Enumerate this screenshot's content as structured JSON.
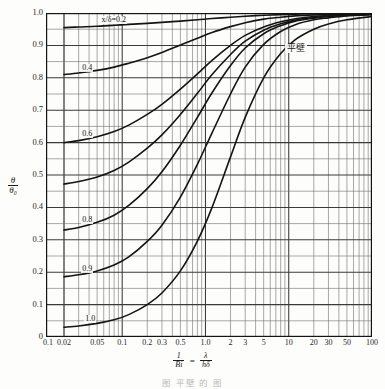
{
  "chart_data": {
    "type": "line",
    "title": "",
    "annotation": "平壁",
    "xlabel_parts": {
      "num": "1",
      "den": "Bi",
      "eq": "=",
      "num2": "λ",
      "den2": "hδ"
    },
    "ylabel_parts": {
      "num": "θ",
      "den": "θ₀"
    },
    "xscale": "log",
    "yscale": "linear",
    "xlim": [
      0.1,
      100
    ],
    "ylim": [
      0,
      1.0
    ],
    "grid": true,
    "xticks": [
      {
        "v": 0.1,
        "label": "0.1"
      },
      {
        "v": 0.02,
        "label": "0.02"
      },
      {
        "v": 0.05,
        "label": "0.05"
      },
      {
        "v": 0.1,
        "label": "0.1"
      },
      {
        "v": 0.2,
        "label": "0.2"
      },
      {
        "v": 0.3,
        "label": "0.3"
      },
      {
        "v": 0.5,
        "label": "0.5"
      },
      {
        "v": 1.0,
        "label": "1.0"
      },
      {
        "v": 2,
        "label": "2"
      },
      {
        "v": 3,
        "label": "3"
      },
      {
        "v": 5,
        "label": "5"
      },
      {
        "v": 10,
        "label": "10"
      },
      {
        "v": 20,
        "label": "20"
      },
      {
        "v": 30,
        "label": "30"
      },
      {
        "v": 50,
        "label": "50"
      },
      {
        "v": 100,
        "label": "100"
      }
    ],
    "yticks": [
      {
        "v": 0,
        "label": "0"
      },
      {
        "v": 0.1,
        "label": "0.1"
      },
      {
        "v": 0.2,
        "label": "0.2"
      },
      {
        "v": 0.3,
        "label": "0.3"
      },
      {
        "v": 0.4,
        "label": "0.4"
      },
      {
        "v": 0.5,
        "label": "0.5"
      },
      {
        "v": 0.6,
        "label": "0.6"
      },
      {
        "v": 0.7,
        "label": "0.7"
      },
      {
        "v": 0.8,
        "label": "0.8"
      },
      {
        "v": 0.9,
        "label": "0.9"
      },
      {
        "v": 1.0,
        "label": "1.0"
      }
    ],
    "series": [
      {
        "name": "x/δ=0.2",
        "label": "x/δ=0.2",
        "label_x": 0.055,
        "label_y": 0.975,
        "points": [
          [
            0.02,
            0.955
          ],
          [
            0.03,
            0.957
          ],
          [
            0.05,
            0.959
          ],
          [
            0.08,
            0.962
          ],
          [
            0.12,
            0.965
          ],
          [
            0.2,
            0.968
          ],
          [
            0.3,
            0.971
          ],
          [
            0.5,
            0.975
          ],
          [
            0.8,
            0.979
          ],
          [
            1.2,
            0.983
          ],
          [
            2,
            0.987
          ],
          [
            3,
            0.99
          ],
          [
            5,
            0.993
          ],
          [
            8,
            0.995
          ],
          [
            12,
            0.9962
          ],
          [
            20,
            0.9972
          ],
          [
            30,
            0.9978
          ],
          [
            50,
            0.9984
          ],
          [
            100,
            0.999
          ]
        ]
      },
      {
        "name": "x/δ=0.4",
        "label": "0.4",
        "label_x": 0.034,
        "label_y": 0.828,
        "points": [
          [
            0.02,
            0.81
          ],
          [
            0.03,
            0.815
          ],
          [
            0.05,
            0.823
          ],
          [
            0.08,
            0.833
          ],
          [
            0.12,
            0.845
          ],
          [
            0.2,
            0.862
          ],
          [
            0.3,
            0.878
          ],
          [
            0.5,
            0.901
          ],
          [
            0.8,
            0.922
          ],
          [
            1.2,
            0.94
          ],
          [
            2,
            0.958
          ],
          [
            3,
            0.97
          ],
          [
            5,
            0.981
          ],
          [
            8,
            0.987
          ],
          [
            12,
            0.991
          ],
          [
            20,
            0.994
          ],
          [
            30,
            0.9955
          ],
          [
            50,
            0.997
          ],
          [
            100,
            0.998
          ]
        ]
      },
      {
        "name": "x/δ=0.6",
        "label": "0.6",
        "label_x": 0.034,
        "label_y": 0.625,
        "points": [
          [
            0.02,
            0.6
          ],
          [
            0.03,
            0.606
          ],
          [
            0.05,
            0.618
          ],
          [
            0.08,
            0.634
          ],
          [
            0.12,
            0.654
          ],
          [
            0.2,
            0.687
          ],
          [
            0.3,
            0.718
          ],
          [
            0.5,
            0.765
          ],
          [
            0.8,
            0.812
          ],
          [
            1.2,
            0.854
          ],
          [
            2,
            0.9
          ],
          [
            3,
            0.931
          ],
          [
            5,
            0.957
          ],
          [
            8,
            0.973
          ],
          [
            12,
            0.982
          ],
          [
            20,
            0.989
          ],
          [
            30,
            0.992
          ],
          [
            50,
            0.995
          ],
          [
            100,
            0.997
          ]
        ]
      },
      {
        "name": "x/δ=0.7",
        "label": "",
        "label_x": null,
        "label_y": null,
        "points": [
          [
            0.02,
            0.472
          ],
          [
            0.03,
            0.48
          ],
          [
            0.05,
            0.494
          ],
          [
            0.08,
            0.514
          ],
          [
            0.12,
            0.54
          ],
          [
            0.2,
            0.583
          ],
          [
            0.3,
            0.624
          ],
          [
            0.5,
            0.687
          ],
          [
            0.8,
            0.752
          ],
          [
            1.2,
            0.81
          ],
          [
            2,
            0.872
          ],
          [
            3,
            0.913
          ],
          [
            5,
            0.947
          ],
          [
            8,
            0.967
          ],
          [
            12,
            0.978
          ],
          [
            20,
            0.986
          ],
          [
            30,
            0.99
          ],
          [
            50,
            0.994
          ],
          [
            100,
            0.996
          ]
        ]
      },
      {
        "name": "x/δ=0.8",
        "label": "0.8",
        "label_x": 0.034,
        "label_y": 0.358,
        "points": [
          [
            0.02,
            0.33
          ],
          [
            0.03,
            0.338
          ],
          [
            0.05,
            0.354
          ],
          [
            0.08,
            0.376
          ],
          [
            0.12,
            0.406
          ],
          [
            0.2,
            0.458
          ],
          [
            0.3,
            0.51
          ],
          [
            0.5,
            0.592
          ],
          [
            0.8,
            0.678
          ],
          [
            1.2,
            0.754
          ],
          [
            2,
            0.838
          ],
          [
            3,
            0.892
          ],
          [
            5,
            0.936
          ],
          [
            8,
            0.961
          ],
          [
            12,
            0.975
          ],
          [
            20,
            0.984
          ],
          [
            30,
            0.989
          ],
          [
            50,
            0.993
          ],
          [
            100,
            0.996
          ]
        ]
      },
      {
        "name": "x/δ=0.9",
        "label": "0.9",
        "label_x": 0.034,
        "label_y": 0.208,
        "points": [
          [
            0.02,
            0.186
          ],
          [
            0.03,
            0.192
          ],
          [
            0.05,
            0.204
          ],
          [
            0.08,
            0.222
          ],
          [
            0.12,
            0.247
          ],
          [
            0.2,
            0.295
          ],
          [
            0.3,
            0.345
          ],
          [
            0.5,
            0.432
          ],
          [
            0.8,
            0.533
          ],
          [
            1.2,
            0.63
          ],
          [
            2,
            0.75
          ],
          [
            3,
            0.833
          ],
          [
            5,
            0.903
          ],
          [
            8,
            0.943
          ],
          [
            12,
            0.964
          ],
          [
            20,
            0.979
          ],
          [
            30,
            0.985
          ],
          [
            50,
            0.991
          ],
          [
            100,
            0.995
          ]
        ]
      },
      {
        "name": "x/δ=1.0",
        "label": "1.0",
        "label_x": 0.037,
        "label_y": 0.052,
        "points": [
          [
            0.02,
            0.03
          ],
          [
            0.03,
            0.034
          ],
          [
            0.05,
            0.042
          ],
          [
            0.08,
            0.053
          ],
          [
            0.12,
            0.069
          ],
          [
            0.2,
            0.1
          ],
          [
            0.3,
            0.136
          ],
          [
            0.5,
            0.204
          ],
          [
            0.8,
            0.296
          ],
          [
            1.2,
            0.4
          ],
          [
            2,
            0.556
          ],
          [
            3,
            0.678
          ],
          [
            5,
            0.8
          ],
          [
            8,
            0.875
          ],
          [
            12,
            0.918
          ],
          [
            20,
            0.95
          ],
          [
            30,
            0.966
          ],
          [
            50,
            0.979
          ],
          [
            100,
            0.989
          ]
        ]
      }
    ],
    "colors": {
      "curve": "#141414",
      "grid_major": "#3a3a3a",
      "grid_minor": "#6f6f6f",
      "axis": "#141414"
    }
  },
  "caption": {
    "text": "图    平壁  的  图"
  }
}
